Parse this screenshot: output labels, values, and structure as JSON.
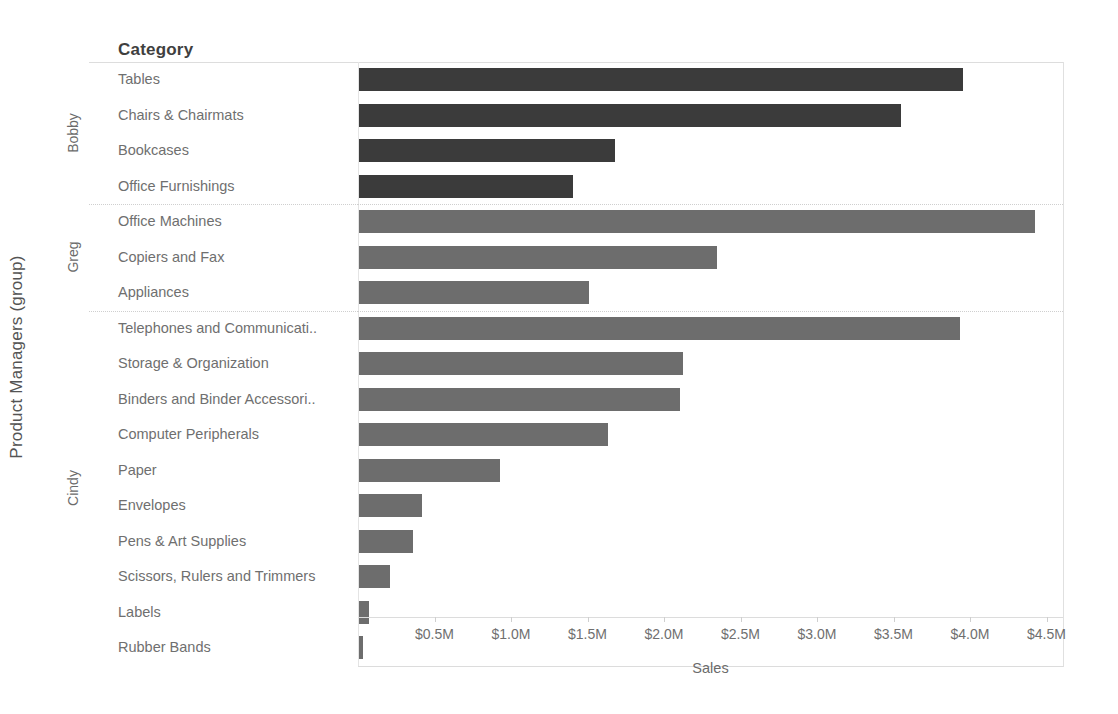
{
  "chart_data": {
    "type": "bar",
    "orientation": "horizontal",
    "title": "",
    "xlabel": "Sales",
    "ylabel": "Product Managers (group)",
    "row_header": "Category",
    "xlim": [
      0,
      4.6
    ],
    "xticks": [
      0.5,
      1.0,
      1.5,
      2.0,
      2.5,
      3.0,
      3.5,
      4.0,
      4.5
    ],
    "xtick_labels": [
      "$0.5M",
      "$1.0M",
      "$1.5M",
      "$2.0M",
      "$2.5M",
      "$3.0M",
      "$3.5M",
      "$4.0M",
      "$4.5M"
    ],
    "grid": false,
    "legend": "none",
    "unit": "millions of dollars",
    "groups": [
      {
        "name": "Bobby",
        "color": "#3b3b3b",
        "categories": [
          "Tables",
          "Chairs & Chairmats",
          "Bookcases",
          "Office Furnishings"
        ],
        "values": [
          3.95,
          3.54,
          1.67,
          1.4
        ]
      },
      {
        "name": "Greg",
        "color": "#6d6d6d",
        "categories": [
          "Office Machines",
          "Copiers and Fax",
          "Appliances"
        ],
        "values": [
          4.42,
          2.34,
          1.5
        ]
      },
      {
        "name": "Cindy",
        "color": "#6d6d6d",
        "categories": [
          "Telephones and Communicati..",
          "Storage & Organization",
          "Binders and Binder Accessori..",
          "Computer Peripherals",
          "Paper",
          "Envelopes",
          "Pens & Art Supplies",
          "Scissors, Rulers and Trimmers",
          "Labels",
          "Rubber Bands"
        ],
        "values": [
          3.93,
          2.12,
          2.1,
          1.63,
          0.92,
          0.41,
          0.35,
          0.2,
          0.065,
          0.025
        ]
      }
    ]
  },
  "axis": {
    "y_title": "Product Managers (group)",
    "x_title": "Sales",
    "row_header": "Category"
  }
}
